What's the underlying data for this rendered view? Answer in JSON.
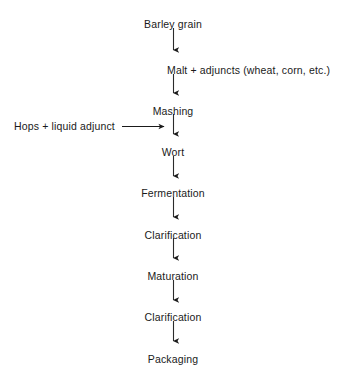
{
  "diagram": {
    "type": "vertical-flowchart",
    "text_color": "#1a1a1a",
    "arrow_color": "#1a1a1a",
    "background_color": "#ffffff",
    "nodes": [
      {
        "id": "barley-grain",
        "label": "Barley grain",
        "x": 180,
        "y": 20,
        "align": "center"
      },
      {
        "id": "malt-adjuncts",
        "label": "Malt + adjuncts (wheat, corn, etc.)",
        "x": 167,
        "y": 66,
        "align": "left"
      },
      {
        "id": "mashing",
        "label": "Mashing",
        "x": 176,
        "y": 107,
        "align": "center"
      },
      {
        "id": "wort",
        "label": "Wort",
        "x": 176,
        "y": 148,
        "align": "center"
      },
      {
        "id": "fermentation",
        "label": "Fermentation",
        "x": 176,
        "y": 189,
        "align": "center"
      },
      {
        "id": "clarification-1",
        "label": "Clarification",
        "x": 176,
        "y": 231,
        "align": "center"
      },
      {
        "id": "maturation",
        "label": "Maturation",
        "x": 176,
        "y": 272,
        "align": "center"
      },
      {
        "id": "clarification-2",
        "label": "Clarification",
        "x": 176,
        "y": 313,
        "align": "center"
      },
      {
        "id": "packaging",
        "label": "Packaging",
        "x": 176,
        "y": 355,
        "align": "center"
      }
    ],
    "side_inputs": [
      {
        "id": "hops-liquid-adjunct",
        "label": "Hops + liquid adjunct",
        "x": 14,
        "y": 126,
        "target": "mashing-to-wort"
      }
    ],
    "arrows": [
      {
        "id": "arrow-barley-to-malt",
        "from": "barley-grain",
        "to": "malt-adjuncts",
        "direction": "down",
        "x": 173,
        "y1": 28,
        "y2": 52
      },
      {
        "id": "arrow-malt-to-mashing",
        "from": "malt-adjuncts",
        "to": "mashing",
        "direction": "down",
        "x": 173,
        "y1": 74,
        "y2": 95
      },
      {
        "id": "arrow-mashing-to-wort",
        "from": "mashing",
        "to": "wort",
        "direction": "down",
        "x": 173,
        "y1": 114,
        "y2": 136
      },
      {
        "id": "arrow-wort-to-fermentation",
        "from": "wort",
        "to": "fermentation",
        "direction": "down",
        "x": 173,
        "y1": 156,
        "y2": 178
      },
      {
        "id": "arrow-fermentation-to-clarification",
        "from": "fermentation",
        "to": "clarification-1",
        "direction": "down",
        "x": 173,
        "y1": 197,
        "y2": 219
      },
      {
        "id": "arrow-clarification-to-maturation",
        "from": "clarification-1",
        "to": "maturation",
        "direction": "down",
        "x": 173,
        "y1": 238,
        "y2": 260
      },
      {
        "id": "arrow-maturation-to-clarification",
        "from": "maturation",
        "to": "clarification-2",
        "direction": "down",
        "x": 173,
        "y1": 280,
        "y2": 302
      },
      {
        "id": "arrow-clarification-to-packaging",
        "from": "clarification-2",
        "to": "packaging",
        "direction": "down",
        "x": 173,
        "y1": 321,
        "y2": 343
      },
      {
        "id": "arrow-hops-into-flow",
        "from": "hops-liquid-adjunct",
        "to": "mashing-to-wort",
        "direction": "right",
        "y": 126,
        "x1": 122,
        "x2": 166
      }
    ]
  }
}
